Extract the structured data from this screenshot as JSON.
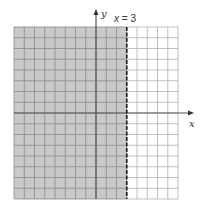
{
  "chart_data": {
    "type": "inequality-graph",
    "title": "",
    "inequality": "x < 3",
    "boundary": {
      "equation": "x = 3",
      "x": 3,
      "style": "dashed"
    },
    "shaded_region": "x < 3",
    "xlabel": "x",
    "ylabel": "y",
    "xlim": [
      -8,
      8
    ],
    "ylim": [
      -8,
      8
    ],
    "grid": true,
    "grid_step": 1,
    "tick_labels": false
  },
  "labels": {
    "x_axis": "x",
    "y_axis": "y",
    "boundary_var": "x",
    "boundary_rest": " = 3"
  },
  "colors": {
    "shade": "#c9c9c9",
    "grid_shaded": "#8a8a8a",
    "grid_unshaded": "#b0b0b0",
    "axis": "#555555",
    "boundary": "#1a1a1a"
  }
}
